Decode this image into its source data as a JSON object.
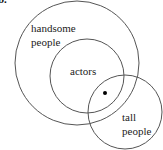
{
  "figure_label": "b.",
  "diagram": {
    "type": "venn",
    "stroke_color": "#555555",
    "sets": [
      {
        "id": "handsome",
        "label_line1": "handsome",
        "label_line2": "people",
        "cx": 77,
        "cy": 63,
        "r": 62
      },
      {
        "id": "actors",
        "label": "actors",
        "cx": 87,
        "cy": 76,
        "r": 37
      },
      {
        "id": "tall",
        "label_line1": "tall",
        "label_line2": "people",
        "cx": 125,
        "cy": 112,
        "r": 37
      }
    ],
    "point": {
      "cx": 105,
      "cy": 93,
      "r": 2,
      "color": "#000000"
    }
  }
}
